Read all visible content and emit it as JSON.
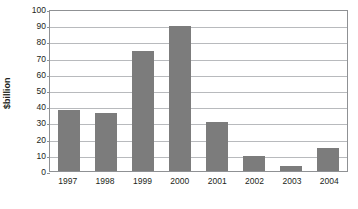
{
  "chart_data": {
    "type": "bar",
    "title": "",
    "xlabel": "",
    "ylabel": "$billion",
    "categories": [
      "1997",
      "1998",
      "1999",
      "2000",
      "2001",
      "2002",
      "2003",
      "2004"
    ],
    "values": [
      37.5,
      36,
      74,
      89.5,
      30,
      9,
      3,
      14.5
    ],
    "ylim": [
      0,
      100
    ],
    "ytick_labels": [
      "100",
      "90",
      "80",
      "70",
      "60",
      "50",
      "40",
      "30",
      "20",
      "10",
      "0"
    ],
    "ytick_values": [
      100,
      90,
      80,
      70,
      60,
      50,
      40,
      30,
      20,
      10,
      0
    ],
    "ytick_step": 10,
    "grid": true,
    "legend": false,
    "series": [
      {
        "name": "$billion",
        "values": [
          37.5,
          36,
          74,
          89.5,
          30,
          9,
          3,
          14.5
        ]
      }
    ],
    "colors": {
      "bar_fill": "#7c7c7c",
      "gridline": "#b8babd",
      "axis_frame": "#8f9194",
      "text": "#231f20",
      "background": "#ffffff"
    }
  }
}
